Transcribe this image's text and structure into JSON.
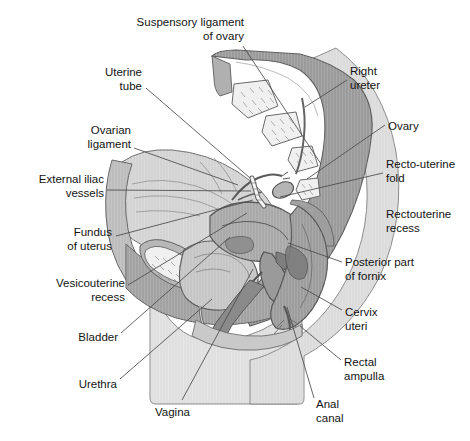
{
  "figure": {
    "type": "anatomical-illustration",
    "width": 470,
    "height": 441,
    "background_color": "#ffffff",
    "text_color": "#141414",
    "leader_line_color": "#4a4a4a"
  },
  "palette": {
    "outline": "#5a5a5a",
    "bone_sacrum": "#9b9b9b",
    "bone_cancellous": "#f0f0f0",
    "soft_tissue_light": "#d2d2d2",
    "soft_tissue_mid": "#b4b4b4",
    "soft_tissue_dark": "#8f8f8f",
    "perineum_pale": "#dedede",
    "cavity_dark": "#787878",
    "bladder_fill": "#c4c4c4",
    "uterus_fill": "#a8a8a8",
    "rectum_fill": "#9c9c9c",
    "vessel_white": "#f5f5f5"
  },
  "labels": [
    {
      "id": "suspensory-ligament-of-ovary",
      "lines": [
        "Suspensory ligament",
        "of ovary"
      ],
      "align": "right",
      "text_x": 244,
      "text_y": 16,
      "leader": [
        [
          243,
          46
        ],
        [
          321,
          164
        ]
      ]
    },
    {
      "id": "uterine-tube",
      "lines": [
        "Uterine",
        "tube"
      ],
      "align": "right",
      "text_x": 142,
      "text_y": 66,
      "leader": [
        [
          146,
          88
        ],
        [
          250,
          178
        ]
      ]
    },
    {
      "id": "ovarian-ligament",
      "lines": [
        "Ovarian",
        "ligament"
      ],
      "align": "right",
      "text_x": 131,
      "text_y": 124,
      "leader": [
        [
          134,
          148
        ],
        [
          238,
          185
        ]
      ]
    },
    {
      "id": "external-iliac-vessels",
      "lines": [
        "External iliac",
        "vessels"
      ],
      "align": "right",
      "text_x": 104,
      "text_y": 173,
      "leader": [
        [
          107,
          190
        ],
        [
          251,
          191
        ]
      ]
    },
    {
      "id": "fundus-of-uterus",
      "lines": [
        "Fundus",
        "of uterus"
      ],
      "align": "right",
      "text_x": 112,
      "text_y": 226,
      "leader": [
        [
          116,
          236
        ],
        [
          253,
          200
        ]
      ]
    },
    {
      "id": "vesicouterine-recess",
      "lines": [
        "Vesicouterine",
        "recess"
      ],
      "align": "right",
      "text_x": 125,
      "text_y": 277,
      "leader": [
        [
          128,
          285
        ],
        [
          247,
          213
        ]
      ]
    },
    {
      "id": "bladder",
      "lines": [
        "Bladder"
      ],
      "align": "right",
      "text_x": 118,
      "text_y": 331,
      "leader": [
        [
          121,
          333
        ],
        [
          230,
          237
        ]
      ]
    },
    {
      "id": "urethra",
      "lines": [
        "Urethra"
      ],
      "align": "right",
      "text_x": 117,
      "text_y": 378,
      "leader": [
        [
          120,
          379
        ],
        [
          212,
          299
        ]
      ]
    },
    {
      "id": "vagina",
      "lines": [
        "Vagina"
      ],
      "align": "left",
      "text_x": 155,
      "text_y": 406,
      "leader": [
        [
          182,
          400
        ],
        [
          253,
          269
        ]
      ]
    },
    {
      "id": "anal-canal",
      "lines": [
        "Anal",
        "canal"
      ],
      "align": "left",
      "text_x": 316,
      "text_y": 398,
      "leader": [
        [
          314,
          398
        ],
        [
          287,
          307
        ]
      ]
    },
    {
      "id": "rectal-ampulla",
      "lines": [
        "Rectal",
        "ampulla"
      ],
      "align": "left",
      "text_x": 344,
      "text_y": 356,
      "leader": [
        [
          341,
          360
        ],
        [
          300,
          326
        ]
      ]
    },
    {
      "id": "cervix-uteri",
      "lines": [
        "Cervix",
        "uteri"
      ],
      "align": "left",
      "text_x": 345,
      "text_y": 306,
      "leader": [
        [
          342,
          310
        ],
        [
          301,
          287
        ]
      ]
    },
    {
      "id": "posterior-part-of-fornix",
      "lines": [
        "Posterior part",
        "of fornix"
      ],
      "align": "left",
      "text_x": 345,
      "text_y": 256,
      "leader": [
        [
          342,
          262
        ],
        [
          288,
          243
        ]
      ]
    },
    {
      "id": "rectouterine-recess",
      "lines": [
        "Rectouterine",
        "recess"
      ],
      "align": "left",
      "text_x": 386,
      "text_y": 208,
      "leader": null
    },
    {
      "id": "recto-uterine-fold",
      "lines": [
        "Recto-uterine",
        "fold"
      ],
      "align": "left",
      "text_x": 386,
      "text_y": 158,
      "leader": [
        [
          383,
          173
        ],
        [
          280,
          197
        ]
      ]
    },
    {
      "id": "ovary",
      "lines": [
        "Ovary"
      ],
      "align": "left",
      "text_x": 388,
      "text_y": 120,
      "leader": [
        [
          385,
          125
        ],
        [
          307,
          179
        ]
      ]
    },
    {
      "id": "right-ureter",
      "lines": [
        "Right",
        "ureter"
      ],
      "align": "left",
      "text_x": 350,
      "text_y": 65,
      "leader": [
        [
          347,
          80
        ],
        [
          305,
          107
        ]
      ]
    }
  ],
  "structures": [
    {
      "id": "sacrum",
      "name": "Sacrum / coccyx",
      "tone": "bone_sacrum"
    },
    {
      "id": "cancellous-bone-bodies",
      "name": "Cancellous bone of sacral vertebral bodies",
      "count": 5,
      "tone": "bone_cancellous"
    },
    {
      "id": "pubic-symphysis",
      "name": "Pubic bone cancellous marrow",
      "tone": "bone_cancellous"
    },
    {
      "id": "bladder",
      "name": "Urinary bladder",
      "tone": "bladder_fill"
    },
    {
      "id": "uterus",
      "name": "Uterus body and fundus",
      "tone": "uterus_fill"
    },
    {
      "id": "rectum",
      "name": "Rectum and rectal ampulla",
      "tone": "rectum_fill"
    },
    {
      "id": "vagina",
      "name": "Vagina",
      "tone": "soft_tissue_dark"
    },
    {
      "id": "perineum",
      "name": "Perineum and thigh soft tissue",
      "tone": "perineum_pale"
    },
    {
      "id": "broad-ligament",
      "name": "Broad ligament / peritoneum sheet",
      "tone": "soft_tissue_light"
    }
  ]
}
